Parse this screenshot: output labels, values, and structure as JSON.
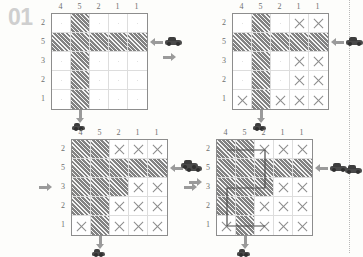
{
  "puzzle": {
    "number": "01",
    "type": "grid-logic-puzzle",
    "grid_size": 5,
    "column_clues": [
      "4",
      "5",
      "2",
      "1",
      "1"
    ],
    "row_clues": [
      "2",
      "5",
      "3",
      "2",
      "1"
    ],
    "accent_color": "#9a9a9a",
    "fill_color": "#b4b4b4",
    "number_color": "#cfcfcf"
  },
  "icons": {
    "car": "car-icon",
    "arrow_left": "arrow-left-icon",
    "arrow_right": "arrow-right-icon",
    "arrow_down": "arrow-down-icon"
  },
  "panels": [
    {
      "id": "panel-1",
      "step": "1",
      "column_clues": [
        "4",
        "5",
        "2",
        "1",
        "1"
      ],
      "row_clues": [
        "2",
        "5",
        "3",
        "2",
        "1"
      ],
      "cells": [
        [
          "empty",
          "fill",
          "empty",
          "empty",
          "empty"
        ],
        [
          "fill",
          "fill",
          "fill",
          "fill",
          "fill"
        ],
        [
          "empty",
          "fill",
          "empty",
          "empty",
          "empty"
        ],
        [
          "empty",
          "fill",
          "empty",
          "empty",
          "empty"
        ],
        [
          "empty",
          "fill",
          "empty",
          "empty",
          "empty"
        ]
      ],
      "markers": [
        {
          "name": "car-right-row2",
          "kind": "car",
          "side": "right",
          "row": 2
        },
        {
          "name": "car-bottom-col2",
          "kind": "car",
          "side": "bottom",
          "col": 2
        }
      ],
      "arrows": [
        {
          "name": "arrow-into-row2",
          "dir": "left",
          "side": "right",
          "row": 2
        },
        {
          "name": "arrow-into-col2",
          "dir": "down",
          "side": "bottom",
          "col": 2
        }
      ]
    },
    {
      "id": "panel-2",
      "step": "2",
      "column_clues": [
        "4",
        "5",
        "2",
        "1",
        "1"
      ],
      "row_clues": [
        "2",
        "5",
        "3",
        "2",
        "1"
      ],
      "cells": [
        [
          "empty",
          "fill",
          "empty",
          "x",
          "x"
        ],
        [
          "fill",
          "fill",
          "fill",
          "fill",
          "fill"
        ],
        [
          "empty",
          "fill",
          "empty",
          "x",
          "x"
        ],
        [
          "empty",
          "fill",
          "empty",
          "x",
          "x"
        ],
        [
          "x",
          "fill",
          "x",
          "x",
          "x"
        ]
      ],
      "markers": [
        {
          "name": "car-right-row2",
          "kind": "car",
          "side": "right",
          "row": 2
        },
        {
          "name": "car-bottom-col2",
          "kind": "car",
          "side": "bottom",
          "col": 2
        }
      ],
      "arrows": [
        {
          "name": "arrow-into-row2",
          "dir": "left",
          "side": "right",
          "row": 2
        },
        {
          "name": "arrow-into-col2",
          "dir": "down",
          "side": "bottom",
          "col": 2
        }
      ]
    },
    {
      "id": "panel-3",
      "step": "3",
      "column_clues": [
        "4",
        "5",
        "2",
        "1",
        "1"
      ],
      "row_clues": [
        "2",
        "5",
        "3",
        "2",
        "1"
      ],
      "cells": [
        [
          "fill",
          "fill",
          "x",
          "x",
          "x"
        ],
        [
          "fill",
          "fill",
          "fill",
          "fill",
          "fill"
        ],
        [
          "fill",
          "fill",
          "fill",
          "x",
          "x"
        ],
        [
          "fill",
          "fill",
          "x",
          "x",
          "x"
        ],
        [
          "x",
          "fill",
          "x",
          "x",
          "x"
        ]
      ],
      "markers": [
        {
          "name": "car-right-row2",
          "kind": "car",
          "side": "right",
          "row": 2
        },
        {
          "name": "car-bottom-col2",
          "kind": "car",
          "side": "bottom",
          "col": 2
        }
      ],
      "arrows": [
        {
          "name": "arrow-into-row3",
          "dir": "right",
          "side": "left",
          "row": 3
        },
        {
          "name": "arrow-into-row2",
          "dir": "left",
          "side": "right",
          "row": 2
        },
        {
          "name": "arrow-into-col2",
          "dir": "down",
          "side": "bottom",
          "col": 2
        }
      ]
    },
    {
      "id": "panel-4",
      "step": "4",
      "column_clues": [
        "4",
        "5",
        "2",
        "1",
        "1"
      ],
      "row_clues": [
        "2",
        "5",
        "3",
        "2",
        "1"
      ],
      "cells": [
        [
          "fill",
          "fill",
          "x",
          "x",
          "x"
        ],
        [
          "fill",
          "fill",
          "fill",
          "fill",
          "fill"
        ],
        [
          "fill",
          "fill",
          "fill",
          "x",
          "x"
        ],
        [
          "fill",
          "fill",
          "x",
          "x",
          "x"
        ],
        [
          "x",
          "fill",
          "x",
          "x",
          "x"
        ]
      ],
      "route": "M 10 10 L 48 10 L 48 48 L 10 48 L 10 86 L 48 86",
      "markers": [
        {
          "name": "car-right-row2",
          "kind": "car",
          "side": "right",
          "row": 2
        },
        {
          "name": "car-bottom-col2",
          "kind": "car",
          "side": "bottom",
          "col": 2
        }
      ],
      "arrows": [
        {
          "name": "arrow-into-row3",
          "dir": "right",
          "side": "left",
          "row": 3
        },
        {
          "name": "arrow-into-row2",
          "dir": "left",
          "side": "right",
          "row": 2
        },
        {
          "name": "arrow-into-col2",
          "dir": "down",
          "side": "bottom",
          "col": 2
        }
      ],
      "extra_markers": [
        {
          "name": "car-right-row2-outer",
          "kind": "car",
          "side": "right-outer",
          "row": 2
        }
      ]
    }
  ],
  "stray_arrows": [
    {
      "name": "arrow-between-panels",
      "dir": "right",
      "x": 163,
      "y": 52
    },
    {
      "name": "arrow-left-of-panel4",
      "dir": "right",
      "x": 189,
      "y": 177
    }
  ],
  "stray_cars": [
    {
      "name": "car-left-edge-panel4",
      "x": 181,
      "y": 160
    }
  ]
}
